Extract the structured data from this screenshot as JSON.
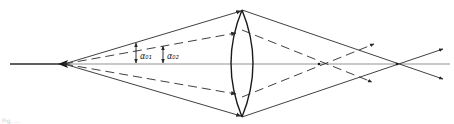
{
  "diagram": {
    "type": "optics-ray-diagram",
    "colors": {
      "line": "#2a2a2a",
      "axis": "#555555",
      "background": "#ffffff"
    },
    "labels": {
      "alpha_01": "α₀₁",
      "alpha_02": "α₀₂"
    },
    "elements": {
      "optical_axis": "optical-axis",
      "source": "point-source",
      "lens": "biconvex-lens",
      "marginal_rays": "solid-rays",
      "paraxial_rays": "dashed-rays",
      "marginal_focus": "marginal-focus-point",
      "paraxial_focus": "paraxial-focus-point"
    },
    "caption": "Fig. ..."
  }
}
